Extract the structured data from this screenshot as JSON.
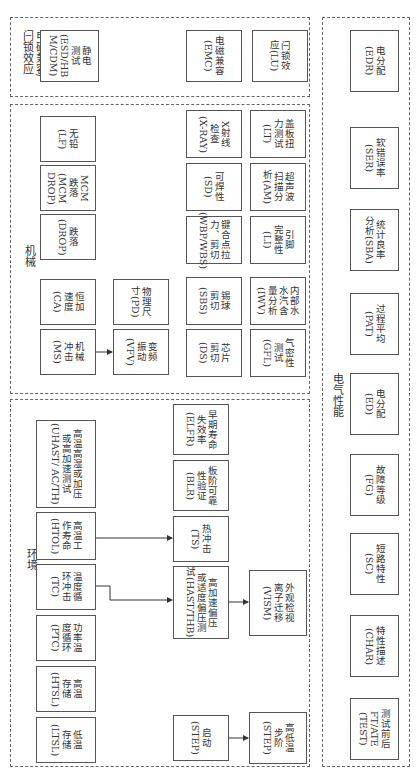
{
  "groups": {
    "esd": {
      "label": "静电测试/\n电磁兼容/\n闩锁效应"
    },
    "mechanical": {
      "label": "机械"
    },
    "environment": {
      "label": "环境"
    },
    "electrical": {
      "label": "电气性能"
    }
  },
  "boxes": {
    "esd": "静电\n测试\n(ESD/HB\nM/CDM)",
    "emc": "电磁兼容\n(EMC)",
    "lu": "闩锁效\n应(LU)",
    "lf": "无铅\n(LF)",
    "mcm_drop": "MCM\n跌落\n(MCM\nDROP)",
    "drop": "跌落\n(DROP)",
    "ca": "恒加\n速度\n(CA)",
    "ms": "机械\n冲击\n(MS)",
    "pd": "物理尺\n寸(PD)",
    "vfv": "变频\n振动\n(VFV)",
    "xray": "X射线\n检查\n(X-RAY)",
    "sd": "可焊性\n(SD)",
    "wbp": "键合点拉\n力、剪切\n(WBP/WBS)",
    "sbs": "锡球\n剪切\n(SBS)",
    "ds": "芯片\n剪切\n(DS)",
    "lt": "盖板扭\n力测试\n(LT)",
    "am": "超声波\n扫描分\n析(AM)",
    "li": "引脚\n完整性\n(LI)",
    "iwv": "内部水\n水汽含\n量分析\n(IWV)",
    "gfl": "气密性\n测试\n(GFL)",
    "uhast": "高温高湿或加压\n或高加速测试\n(UHAST/ AC/TH)",
    "htol": "高温工\n作寿命\n(HTOL)",
    "tc": "温度循\n环冲击\n(TC)",
    "ptc": "功率温\n度循环\n(PTC)",
    "htsl": "高温\n存储\n(HTSL)",
    "ltsl": "低温\n存储\n(LTSL)",
    "elfr": "早期寿命\n失效率\n(ELFR)",
    "blr": "板阶可靠\n性验证\n(BLR)",
    "ts": "热冲击\n(TS)",
    "hast": "高加速偏压\n或适度偏压测\n试(HAST/THB)",
    "vism": "外观检视\n离子迁移\n(VISM)",
    "step_start": "启动\n(STEP)",
    "step": "高低温\n步阶\n(STEP)",
    "edr": "电分配\n(EDR)",
    "ser": "软错误率\n(SER)",
    "sba": "统计良率\n分析(SBA)",
    "pat": "过程平均\n(PAT)",
    "ed": "电分配\n(ED)",
    "fg": "故障等级\n(FG)",
    "sc": "短路特性\n(SC)",
    "char": "特性描述\n(CHAR)",
    "test": "测试前后\nFT/ATE\n(TEST)"
  }
}
